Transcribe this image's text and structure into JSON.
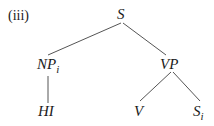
{
  "example_label": "(iii)",
  "tree": {
    "root": {
      "label": "S"
    },
    "left": {
      "label": "NP",
      "subscript": "i",
      "child": {
        "label": "HI"
      }
    },
    "right": {
      "label": "VP",
      "children": [
        {
          "label": "V"
        },
        {
          "label": "S",
          "subscript": "i"
        }
      ]
    }
  },
  "colors": {
    "text": "#1a1a1a",
    "line": "#555555",
    "background": "#ffffff"
  }
}
